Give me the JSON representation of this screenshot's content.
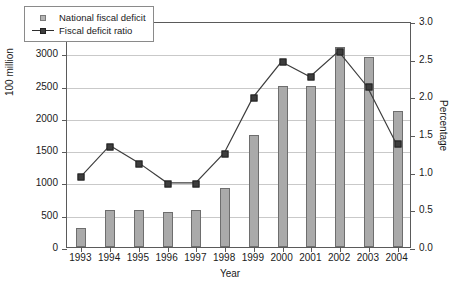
{
  "chart_data": {
    "type": "bar",
    "title": "",
    "subtitle": "",
    "xlabel": "Year",
    "ylabel": "100 million",
    "y2label": "Percentage",
    "categories": [
      "1993",
      "1994",
      "1995",
      "1996",
      "1997",
      "1998",
      "1999",
      "2000",
      "2001",
      "2002",
      "2003",
      "2004"
    ],
    "ylim": [
      0,
      3500
    ],
    "y2lim": [
      0,
      3.0
    ],
    "yticks": [
      "0",
      "500",
      "1000",
      "1500",
      "2000",
      "2500",
      "3000",
      "3500"
    ],
    "y2ticks": [
      "0.0",
      "0.5",
      "1.0",
      "1.5",
      "2.0",
      "2.5",
      "3.0"
    ],
    "grid": true,
    "legend_position": "upper-left",
    "series": [
      {
        "name": "National fiscal deficit",
        "kind": "bar",
        "axis": "left",
        "color": "#aaaaaa",
        "values": [
          300,
          580,
          580,
          550,
          570,
          920,
          1740,
          2500,
          2500,
          3100,
          2950,
          2100
        ]
      },
      {
        "name": "Fiscal deficit ratio",
        "kind": "line",
        "axis": "right",
        "color": "#3d3d3d",
        "values": [
          0.95,
          1.36,
          1.13,
          0.86,
          0.86,
          1.26,
          2.0,
          2.48,
          2.28,
          2.62,
          2.15,
          1.4
        ]
      }
    ]
  },
  "legend": {
    "items": [
      {
        "label": "National fiscal deficit"
      },
      {
        "label": "Fiscal deficit ratio"
      }
    ]
  },
  "colors": {
    "bar_fill": "#aaaaaa",
    "bar_edge": "#6e6e6e",
    "line": "#3d3d3d",
    "grid": "#c9c9c9",
    "axis": "#5a5a5a",
    "text": "#1a1a1a",
    "background": "#ffffff"
  }
}
